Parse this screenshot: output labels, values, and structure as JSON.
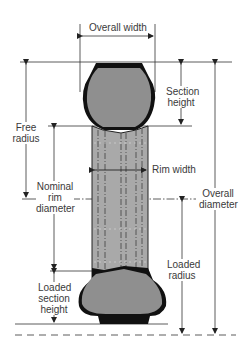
{
  "diagram": {
    "labels": {
      "overall_width": "Overall width",
      "section_height_1": "Section",
      "section_height_2": "height",
      "free_radius_1": "Free",
      "free_radius_2": "radius",
      "rim_width": "Rim width",
      "nominal_rim_diameter_1": "Nominal",
      "nominal_rim_diameter_2": "rim",
      "nominal_rim_diameter_3": "diameter",
      "overall_diameter_1": "Overall",
      "overall_diameter_2": "diameter",
      "loaded_radius_1": "Loaded",
      "loaded_radius_2": "radius",
      "loaded_section_height_1": "Loaded",
      "loaded_section_height_2": "section",
      "loaded_section_height_3": "height"
    },
    "colors": {
      "tire_fill": "#8f8f8f",
      "tread": "#111111",
      "rim_fill": "#a9a9a9",
      "line": "#333333",
      "text": "#3a3a3a"
    }
  }
}
